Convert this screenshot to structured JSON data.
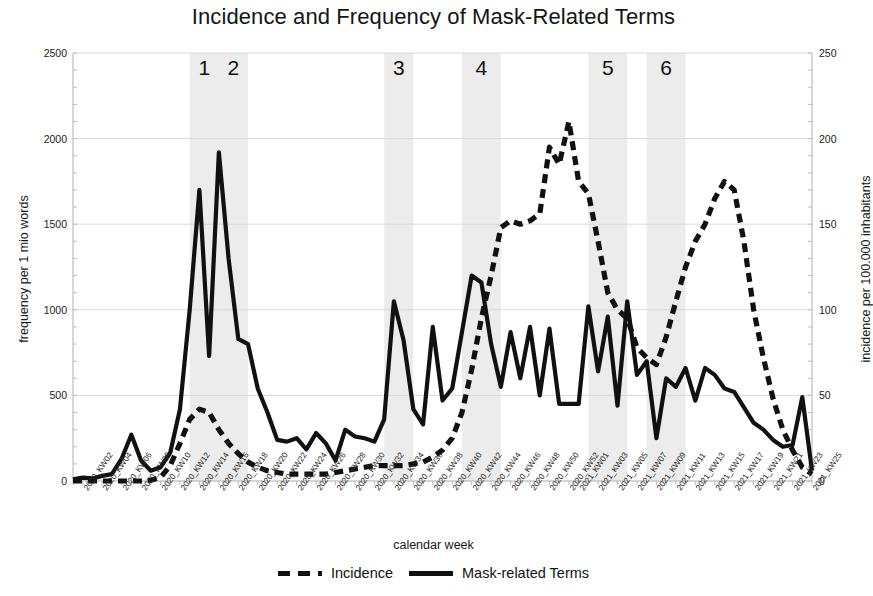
{
  "chart_data": {
    "type": "line",
    "title": "Incidence and Frequency of Mask-Related Terms",
    "xlabel": "calendar week",
    "ylabel": "frequency per 1 mio words",
    "y2label": "incidence per 100.000 inhabitants",
    "ylim": [
      0,
      2500
    ],
    "yticks": [
      0,
      500,
      1000,
      1500,
      2000,
      2500
    ],
    "y2lim": [
      0,
      250
    ],
    "y2ticks": [
      0,
      50,
      100,
      150,
      200,
      250
    ],
    "grid": true,
    "legend_position": "bottom",
    "x": [
      "2020_KW01",
      "2020_KW02",
      "2020_KW03",
      "2020_KW04",
      "2020_KW05",
      "2020_KW06",
      "2020_KW07",
      "2020_KW08",
      "2020_KW09",
      "2020_KW10",
      "2020_KW11",
      "2020_KW12",
      "2020_KW13",
      "2020_KW14",
      "2020_KW15",
      "2020_KW16",
      "2020_KW17",
      "2020_KW18",
      "2020_KW19",
      "2020_KW20",
      "2020_KW21",
      "2020_KW22",
      "2020_KW23",
      "2020_KW24",
      "2020_KW25",
      "2020_KW26",
      "2020_KW27",
      "2020_KW28",
      "2020_KW29",
      "2020_KW30",
      "2020_KW31",
      "2020_KW32",
      "2020_KW33",
      "2020_KW34",
      "2020_KW35",
      "2020_KW36",
      "2020_KW37",
      "2020_KW38",
      "2020_KW39",
      "2020_KW40",
      "2020_KW41",
      "2020_KW42",
      "2020_KW43",
      "2020_KW44",
      "2020_KW45",
      "2020_KW46",
      "2020_KW47",
      "2020_KW48",
      "2020_KW49",
      "2020_KW50",
      "2020_KW51",
      "2020_KW52",
      "2021_KW01",
      "2021_KW02",
      "2021_KW03",
      "2021_KW04",
      "2021_KW05",
      "2021_KW06",
      "2021_KW07",
      "2021_KW08",
      "2021_KW09",
      "2021_KW10",
      "2021_KW11",
      "2021_KW12",
      "2021_KW13",
      "2021_KW14",
      "2021_KW15",
      "2021_KW16",
      "2021_KW17",
      "2021_KW18",
      "2021_KW19",
      "2021_KW20",
      "2021_KW21",
      "2021_KW22",
      "2021_KW23",
      "2021_KW24",
      "2021_KW25"
    ],
    "xtick_labels": [
      "2020_KW02",
      "2020_KW04",
      "2020_KW06",
      "2020_KW08",
      "2020_KW10",
      "2020_KW12",
      "2020_KW14",
      "2020_KW16",
      "2020_KW18",
      "2020_KW20",
      "2020_KW22",
      "2020_KW24",
      "2020_KW26",
      "2020_KW28",
      "2020_KW30",
      "2020_KW32",
      "2020_KW34",
      "2020_KW36",
      "2020_KW38",
      "2020_KW40",
      "2020_KW42",
      "2020_KW44",
      "2020_KW46",
      "2020_KW48",
      "2020_KW50",
      "2020_KW52",
      "2021_KW01",
      "2021_KW03",
      "2021_KW05",
      "2021_KW07",
      "2021_KW09",
      "2021_KW11",
      "2021_KW13",
      "2021_KW15",
      "2021_KW17",
      "2021_KW19",
      "2021_KW21",
      "2021_KW23",
      "2021_KW25"
    ],
    "series": [
      {
        "name": "Mask-related Terms",
        "style": "solid",
        "axis": "left",
        "unit": "frequency per 1 mio words",
        "values": [
          10,
          20,
          15,
          30,
          40,
          130,
          270,
          120,
          60,
          80,
          165,
          420,
          1000,
          1700,
          730,
          1920,
          1300,
          830,
          800,
          540,
          400,
          240,
          230,
          250,
          185,
          280,
          220,
          120,
          300,
          260,
          250,
          230,
          360,
          1050,
          820,
          420,
          330,
          900,
          470,
          540,
          870,
          1200,
          1160,
          800,
          550,
          870,
          600,
          900,
          500,
          890,
          450,
          450,
          450,
          1020,
          640,
          960,
          440,
          1050,
          620,
          700,
          250,
          600,
          550,
          660,
          470,
          660,
          620,
          540,
          520,
          430,
          340,
          300,
          240,
          200,
          210,
          490,
          60
        ]
      },
      {
        "name": "Incidence",
        "style": "dashed",
        "axis": "right",
        "unit": "incidence per 100.000 inhabitants",
        "values": [
          0,
          0,
          0,
          0,
          0,
          0,
          0,
          0,
          0.5,
          2,
          9,
          22,
          36,
          42,
          40,
          30,
          22,
          16,
          11,
          8,
          6,
          5,
          4,
          4,
          4,
          4,
          4,
          5,
          6,
          7,
          8,
          9,
          9,
          9,
          9,
          10,
          11,
          14,
          18,
          25,
          40,
          65,
          95,
          120,
          148,
          152,
          150,
          152,
          156,
          195,
          185,
          210,
          175,
          168,
          140,
          110,
          100,
          95,
          78,
          72,
          68,
          84,
          105,
          125,
          140,
          150,
          165,
          175,
          170,
          140,
          100,
          72,
          48,
          30,
          18,
          8,
          4
        ]
      }
    ],
    "annotations": [
      {
        "label": "1",
        "x_start": "2020_KW13",
        "x_end": "2020_KW16",
        "type": "shaded-band"
      },
      {
        "label": "2",
        "x_start": "2020_KW16",
        "x_end": "2020_KW19",
        "type": "shaded-band"
      },
      {
        "label": "3",
        "x_start": "2020_KW33",
        "x_end": "2020_KW36",
        "type": "shaded-band"
      },
      {
        "label": "4",
        "x_start": "2020_KW41",
        "x_end": "2020_KW45",
        "type": "shaded-band"
      },
      {
        "label": "5",
        "x_start": "2021_KW02",
        "x_end": "2021_KW06",
        "type": "shaded-band"
      },
      {
        "label": "6",
        "x_start": "2021_KW08",
        "x_end": "2021_KW12",
        "type": "shaded-band"
      }
    ],
    "colors": {
      "line": "#111111",
      "band": "#ececec",
      "grid": "#d9d9d9",
      "axis": "#bdbdbd"
    }
  },
  "legend": {
    "items": [
      {
        "label": "Incidence",
        "style": "dashed"
      },
      {
        "label": "Mask-related Terms",
        "style": "solid"
      }
    ]
  }
}
